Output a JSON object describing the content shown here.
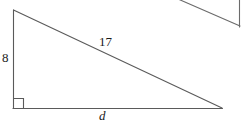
{
  "figure": {
    "kind": "geometry-diagram",
    "canvas": {
      "width": 247,
      "height": 126,
      "background": "#ffffff"
    },
    "stroke_color": "#5a5a5a",
    "text_color": "#1a1a1a",
    "stroke_width": 1,
    "main_triangle": {
      "name": "right-triangle",
      "vertices": {
        "top_left": {
          "x": 13,
          "y": 10
        },
        "bottom_left": {
          "x": 13,
          "y": 108
        },
        "bottom_right": {
          "x": 222,
          "y": 108
        }
      },
      "right_angle_marker": {
        "corner": "bottom_left",
        "size": 10
      },
      "sides": [
        {
          "name": "vertical-leg",
          "label": "8",
          "style": "upright"
        },
        {
          "name": "hypotenuse",
          "label": "17",
          "style": "upright"
        },
        {
          "name": "base",
          "label": "d",
          "style": "italic"
        }
      ]
    },
    "partial_triangle": {
      "name": "cropped-triangle-top-right",
      "diagonal": {
        "x1": 178,
        "y1": 0,
        "x2": 240,
        "y2": 26
      },
      "vertical": {
        "x1": 239,
        "y1": 0,
        "x2": 239,
        "y2": 27
      }
    }
  },
  "labels": {
    "leg_vertical": "8",
    "hypotenuse": "17",
    "base": "d"
  }
}
